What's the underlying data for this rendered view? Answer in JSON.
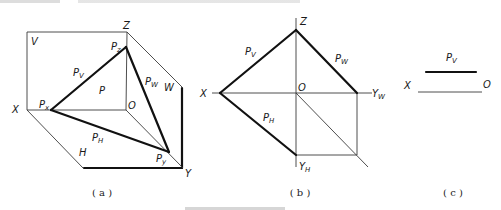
{
  "figure": {
    "panels": [
      {
        "id": "a",
        "caption": "( a )",
        "labels": {
          "Z": "Z",
          "V": "V",
          "Pz_main": "P",
          "Pz_sub": "z",
          "Pv_main": "P",
          "Pv_sub": "V",
          "P": "P",
          "Pw_main": "P",
          "Pw_sub": "W",
          "W": "W",
          "X": "X",
          "Px_main": "P",
          "Px_sub": "x",
          "O": "O",
          "Ph_main": "P",
          "Ph_sub": "H",
          "H": "H",
          "Py_main": "P",
          "Py_sub": "y",
          "Y": "Y"
        }
      },
      {
        "id": "b",
        "caption": "( b )",
        "labels": {
          "Z": "Z",
          "Pv_main": "P",
          "Pv_sub": "V",
          "Pw_main": "P",
          "Pw_sub": "W",
          "X": "X",
          "O": "O",
          "Yw_main": "Y",
          "Yw_sub": "W",
          "Ph_main": "P",
          "Ph_sub": "H",
          "Yh_main": "Y",
          "Yh_sub": "H"
        }
      },
      {
        "id": "c",
        "caption": "( c )",
        "labels": {
          "Pv_main": "P",
          "Pv_sub": "V",
          "X": "X",
          "O": "O"
        }
      }
    ],
    "colors": {
      "line": "#111111",
      "thin_line": "#3a3a3a",
      "background": "#ffffff"
    }
  }
}
